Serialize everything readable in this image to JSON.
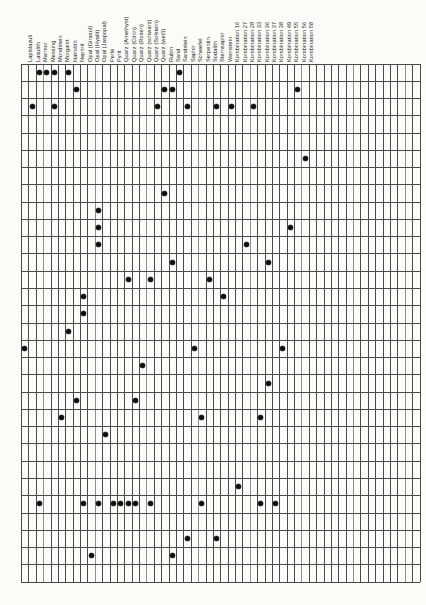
{
  "chart_data": {
    "type": "matrix",
    "title": "",
    "columns": [
      "Lapislazuli",
      "Lasulith",
      "Marmor",
      "Messing",
      "Mondstein",
      "Morganit",
      "Natrolith",
      "Nephrit",
      "Opal (Girasol)",
      "Opal (Hyalit)",
      "Opal (Jaspopal)",
      "Perle",
      "Pyrit",
      "Quarz (Amethyst)",
      "Quarz (Citrin)",
      "Quarz (Rosen)",
      "Quarz (schwarz)",
      "Quarz (Solstein)",
      "Quarz (weiß)",
      "Rubin",
      "Sand",
      "Sandstein",
      "Saphir",
      "Schwefel",
      "Serpentin",
      "Sodalith",
      "Sternsaphir",
      "Weinstein",
      "Kombination 16",
      "Kombination 27",
      "Kombination 28",
      "Kombination 33",
      "Kombination 36",
      "Kombination 37",
      "Kombination 38",
      "Kombination 49",
      "Kombination 55",
      "Kombination 56",
      "Kombination 58"
    ],
    "rows_total": 30,
    "cols_total": 54,
    "marks": [
      {
        "row": 1,
        "col": 3
      },
      {
        "row": 1,
        "col": 4
      },
      {
        "row": 1,
        "col": 5
      },
      {
        "row": 1,
        "col": 7
      },
      {
        "row": 1,
        "col": 22
      },
      {
        "row": 2,
        "col": 8
      },
      {
        "row": 2,
        "col": 20
      },
      {
        "row": 2,
        "col": 21
      },
      {
        "row": 2,
        "col": 38
      },
      {
        "row": 3,
        "col": 2
      },
      {
        "row": 3,
        "col": 5
      },
      {
        "row": 3,
        "col": 19
      },
      {
        "row": 3,
        "col": 23
      },
      {
        "row": 3,
        "col": 27
      },
      {
        "row": 3,
        "col": 29
      },
      {
        "row": 3,
        "col": 32
      },
      {
        "row": 6,
        "col": 39
      },
      {
        "row": 8,
        "col": 20
      },
      {
        "row": 9,
        "col": 11
      },
      {
        "row": 10,
        "col": 11
      },
      {
        "row": 10,
        "col": 37
      },
      {
        "row": 11,
        "col": 11
      },
      {
        "row": 11,
        "col": 31
      },
      {
        "row": 12,
        "col": 21
      },
      {
        "row": 12,
        "col": 34
      },
      {
        "row": 13,
        "col": 15
      },
      {
        "row": 13,
        "col": 18
      },
      {
        "row": 13,
        "col": 26
      },
      {
        "row": 14,
        "col": 9
      },
      {
        "row": 14,
        "col": 28
      },
      {
        "row": 15,
        "col": 9
      },
      {
        "row": 16,
        "col": 7
      },
      {
        "row": 17,
        "col": 1
      },
      {
        "row": 17,
        "col": 24
      },
      {
        "row": 17,
        "col": 36
      },
      {
        "row": 18,
        "col": 17
      },
      {
        "row": 19,
        "col": 34
      },
      {
        "row": 20,
        "col": 8
      },
      {
        "row": 20,
        "col": 16
      },
      {
        "row": 21,
        "col": 6
      },
      {
        "row": 21,
        "col": 25
      },
      {
        "row": 21,
        "col": 33
      },
      {
        "row": 22,
        "col": 12
      },
      {
        "row": 25,
        "col": 30
      },
      {
        "row": 26,
        "col": 3
      },
      {
        "row": 26,
        "col": 9
      },
      {
        "row": 26,
        "col": 11
      },
      {
        "row": 26,
        "col": 13
      },
      {
        "row": 26,
        "col": 14
      },
      {
        "row": 26,
        "col": 15
      },
      {
        "row": 26,
        "col": 16
      },
      {
        "row": 26,
        "col": 18
      },
      {
        "row": 26,
        "col": 25
      },
      {
        "row": 26,
        "col": 33
      },
      {
        "row": 26,
        "col": 35
      },
      {
        "row": 28,
        "col": 23
      },
      {
        "row": 28,
        "col": 27
      },
      {
        "row": 29,
        "col": 10
      },
      {
        "row": 29,
        "col": 21
      }
    ],
    "layout": {
      "grid_left": 21,
      "grid_top": 63.5,
      "col_width": 7.38,
      "row_height": 17.27,
      "label_baseline_y": 62,
      "legend": "none",
      "grid_on": true
    },
    "colors": {
      "paper": "#fbfbf8",
      "grid_line": "#4a4a48",
      "dot": "#0e0e0e",
      "label_text": "#1c1c1c"
    }
  }
}
